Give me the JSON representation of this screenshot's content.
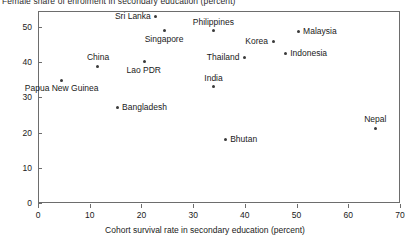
{
  "chart_data": {
    "type": "scatter",
    "title": "Female share of enrolment in secondary education (percent)",
    "xlabel": "Cohort survival rate in secondary education (percent)",
    "ylabel": "",
    "xlim": [
      0,
      70
    ],
    "ylim": [
      0,
      54.5
    ],
    "grid": false,
    "legend": "none",
    "xticks": [
      "0",
      "10",
      "20",
      "30",
      "40",
      "50",
      "60",
      "70"
    ],
    "yticks": [
      "0",
      "10",
      "20",
      "30",
      "40",
      "50"
    ],
    "xtick_values": [
      0,
      10,
      20,
      30,
      40,
      50,
      60,
      70
    ],
    "ytick_values": [
      0,
      10,
      20,
      30,
      40,
      50
    ],
    "points": [
      {
        "name": "Sri Lanka",
        "x": 22.8,
        "y": 53.0,
        "label_pos": "left"
      },
      {
        "name": "Singapore",
        "x": 24.4,
        "y": 48.9,
        "label_pos": "below"
      },
      {
        "name": "Philippines",
        "x": 33.9,
        "y": 48.9,
        "label_pos": "above"
      },
      {
        "name": "Malaysia",
        "x": 50.3,
        "y": 48.6,
        "label_pos": "right"
      },
      {
        "name": "Korea",
        "x": 45.5,
        "y": 46.0,
        "label_pos": "left"
      },
      {
        "name": "Indonesia",
        "x": 47.8,
        "y": 42.6,
        "label_pos": "right"
      },
      {
        "name": "Thailand",
        "x": 40.0,
        "y": 41.2,
        "label_pos": "left"
      },
      {
        "name": "Lao PDR",
        "x": 20.5,
        "y": 40.1,
        "label_pos": "below"
      },
      {
        "name": "China",
        "x": 11.6,
        "y": 38.9,
        "label_pos": "above"
      },
      {
        "name": "Papua New Guinea",
        "x": 4.6,
        "y": 34.9,
        "label_pos": "below"
      },
      {
        "name": "India",
        "x": 33.9,
        "y": 33.0,
        "label_pos": "above"
      },
      {
        "name": "Bangladesh",
        "x": 15.3,
        "y": 27.0,
        "label_pos": "right"
      },
      {
        "name": "Nepal",
        "x": 65.2,
        "y": 21.3,
        "label_pos": "above"
      },
      {
        "name": "Bhutan",
        "x": 36.2,
        "y": 17.9,
        "label_pos": "right"
      }
    ]
  },
  "axes": {
    "frame_color": "#6d6d6d",
    "point_color": "#3a3a3a",
    "text_color": "#1a1a1a"
  }
}
